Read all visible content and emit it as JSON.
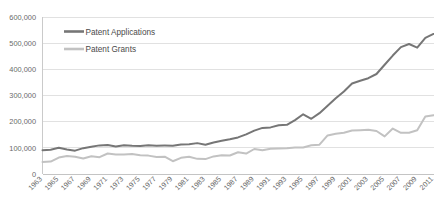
{
  "chart_data": {
    "type": "line",
    "title": "",
    "xlabel": "",
    "ylabel": "",
    "ylim": [
      0,
      600000
    ],
    "ytick_values": [
      0,
      100000,
      200000,
      300000,
      400000,
      500000,
      600000
    ],
    "ytick_labels": [
      "0",
      "100,000",
      "200,000",
      "300,000",
      "400,000",
      "500,000",
      "600,000"
    ],
    "grid": true,
    "legend_position": "top-left-inside",
    "x": [
      1963,
      1964,
      1965,
      1966,
      1967,
      1968,
      1969,
      1970,
      1971,
      1972,
      1973,
      1974,
      1975,
      1976,
      1977,
      1978,
      1979,
      1980,
      1981,
      1982,
      1983,
      1984,
      1985,
      1986,
      1987,
      1988,
      1989,
      1990,
      1991,
      1992,
      1993,
      1994,
      1995,
      1996,
      1997,
      1998,
      1999,
      2000,
      2001,
      2002,
      2003,
      2004,
      2005,
      2006,
      2007,
      2008,
      2009,
      2010,
      2011
    ],
    "xtick_labels": [
      "1963",
      "1965",
      "1967",
      "1969",
      "1971",
      "1973",
      "1975",
      "1977",
      "1979",
      "1981",
      "1983",
      "1985",
      "1987",
      "1989",
      "1991",
      "1993",
      "1995",
      "1997",
      "1999",
      "2001",
      "2003",
      "2005",
      "2007",
      "2009",
      "2011"
    ],
    "series": [
      {
        "name": "Patent Applications",
        "color": "#767676",
        "values": [
          90982,
          92971,
          100150,
          93482,
          89190,
          98737,
          104357,
          109359,
          111095,
          105300,
          109622,
          108011,
          107456,
          110000,
          108377,
          108600,
          108200,
          112379,
          113966,
          117987,
          112040,
          120276,
          126788,
          132865,
          139825,
          151491,
          165748,
          176264,
          178087,
          186507,
          188030,
          206090,
          228238,
          211013,
          232424,
          260889,
          289369,
          315015,
          345732,
          356493,
          366043,
          382139,
          417508,
          452633,
          484955,
          496886,
          482871,
          520277,
          535188
        ]
      },
      {
        "name": "Patent Grants",
        "color": "#c2c2c2",
        "values": [
          45679,
          47376,
          62857,
          68406,
          65652,
          59104,
          67559,
          64429,
          78317,
          74810,
          74143,
          76278,
          71993,
          70226,
          65269,
          66102,
          48854,
          61819,
          65771,
          57889,
          56860,
          67200,
          71661,
          70860,
          82952,
          77924,
          95537,
          90366,
          96513,
          97444,
          98342,
          101676,
          101419,
          109646,
          111983,
          147518,
          153485,
          157494,
          166035,
          167331,
          169023,
          164290,
          143806,
          173772,
          157282,
          157772,
          167349,
          219614,
          224505
        ]
      }
    ]
  },
  "legend": {
    "entries": [
      {
        "label": "Patent Applications",
        "color": "#767676"
      },
      {
        "label": "Patent Grants",
        "color": "#c2c2c2"
      }
    ]
  }
}
